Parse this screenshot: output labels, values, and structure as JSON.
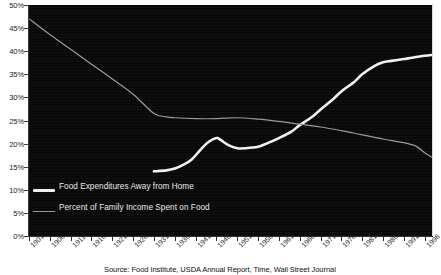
{
  "chart_data": {
    "type": "line",
    "title": "",
    "subtitle": "",
    "xlabel": "",
    "ylabel": "",
    "xlim": [
      1901,
      1998
    ],
    "ylim": [
      0,
      50
    ],
    "ytick_labels": [
      "50%",
      "45%",
      "40%",
      "35%",
      "30%",
      "25%",
      "20%",
      "15%",
      "10%",
      "5%",
      "0%"
    ],
    "ytick_values": [
      50,
      45,
      40,
      35,
      30,
      25,
      20,
      15,
      10,
      5,
      0
    ],
    "xtick_labels": [
      "1901",
      "1906",
      "1911",
      "1916",
      "1921",
      "1926",
      "1931",
      "1936",
      "1941",
      "1946",
      "1951",
      "1956",
      "1961",
      "1966",
      "1971",
      "1976",
      "1981",
      "1986",
      "1991",
      "1996"
    ],
    "xtick_values": [
      1901,
      1906,
      1911,
      1916,
      1921,
      1926,
      1931,
      1936,
      1941,
      1946,
      1951,
      1956,
      1961,
      1966,
      1971,
      1976,
      1981,
      1986,
      1991,
      1996
    ],
    "grid": false,
    "legend_position": "inside-bottom-left",
    "background_color": "#080808",
    "series": [
      {
        "name": "Food Expenditures Away from Home",
        "color": "#f2f2f2",
        "width": 2.6,
        "x": [
          1931,
          1934,
          1936,
          1938,
          1940,
          1942,
          1944,
          1946,
          1947,
          1949,
          1951,
          1953,
          1956,
          1958,
          1961,
          1964,
          1966,
          1969,
          1971,
          1974,
          1976,
          1979,
          1981,
          1984,
          1986,
          1988,
          1991,
          1993,
          1996,
          1998
        ],
        "values": [
          14.0,
          14.2,
          14.6,
          15.4,
          16.5,
          18.5,
          20.3,
          21.2,
          20.8,
          19.6,
          19.0,
          19.0,
          19.3,
          20.0,
          21.2,
          22.6,
          24.0,
          25.8,
          27.4,
          29.6,
          31.3,
          33.3,
          35.0,
          36.8,
          37.6,
          37.9,
          38.3,
          38.6,
          39.0,
          39.2
        ]
      },
      {
        "name": "Percent of Family Income Spent on Food",
        "color": "#9a9a9a",
        "width": 1.2,
        "x": [
          1901,
          1906,
          1911,
          1916,
          1921,
          1926,
          1931,
          1934,
          1936,
          1941,
          1946,
          1951,
          1956,
          1961,
          1966,
          1971,
          1976,
          1981,
          1986,
          1991,
          1994,
          1996,
          1998
        ],
        "values": [
          47.0,
          43.6,
          40.4,
          37.2,
          34.0,
          30.7,
          26.5,
          25.8,
          25.6,
          25.4,
          25.4,
          25.6,
          25.3,
          24.8,
          24.2,
          23.6,
          22.8,
          21.9,
          21.0,
          20.2,
          19.4,
          18.0,
          16.9
        ]
      }
    ]
  },
  "legend": {
    "items": [
      {
        "label": "Food Expenditures Away from Home",
        "style": "thick"
      },
      {
        "label": "Percent of Family Income Spent on Food",
        "style": "thin"
      }
    ]
  },
  "source": {
    "text": "Source: Food Institute, USDA Annual Report, Time, Wall Street Journal"
  }
}
